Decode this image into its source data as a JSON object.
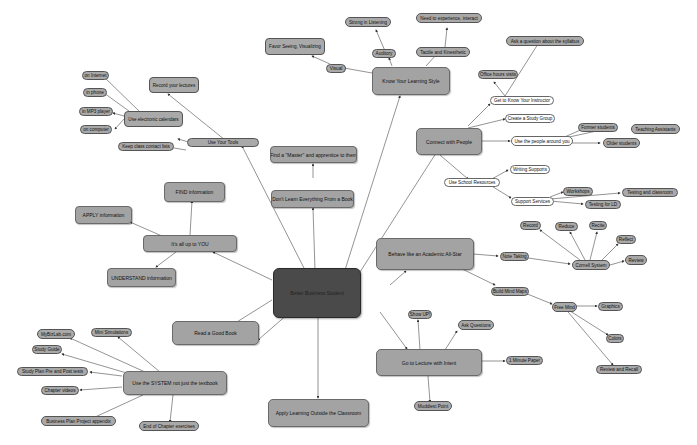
{
  "diagram": {
    "type": "mind-map",
    "colors": {
      "main_node": "#a3a3a3",
      "leaf_node": "#a9a9a9",
      "white_node": "#ffffff",
      "center_node": "#4a4a4a",
      "edge": "#555555"
    },
    "center": {
      "label": "Better Business Student"
    },
    "nodes": {
      "know_style": "Know Your Learning Style",
      "visual": "Visual",
      "favor_seeing": "Favor Seeing, Visualizing",
      "auditory": "Auditory",
      "strong_listening": "Strong in Listening",
      "tactile": "Tactile and Kinesthetic",
      "need_experience": "Need to experience, interact",
      "connect": "Connect with People",
      "get_know": "Get to Know Your Instructor",
      "ask_syllabus": "Ask a question about the syllabus",
      "office_hours": "Office hours visits",
      "study_group": "Create a Study Group",
      "use_people": "Use the people around you",
      "former_students": "Former students",
      "teaching_assistants": "Teaching Assistants",
      "older_students": "Older students",
      "school_resources": "Use School Resources",
      "writing_supports": "Writing Supports",
      "support_services": "Support Services",
      "workshops": "Workshops",
      "testing_classroom": "Testing and classroom",
      "testing_ld": "Testing for LD",
      "allstar": "Behave like an Academic All-Star",
      "note_taking": "Note Taking",
      "cornell": "Cornell System",
      "record": "Record",
      "reduce": "Reduce",
      "recite": "Recite",
      "reflect": "Reflect",
      "review": "Review",
      "mind_maps": "Build Mind Maps",
      "free_mind": "Free Mind",
      "graphics": "Graphics",
      "colors": "Colors",
      "review_recall": "Review and Recall",
      "lecture": "Go to Lecture with Intent",
      "show_up": "Show UP!",
      "ask_questions": "Ask Questions",
      "one_minute": "1 Minute Paper",
      "muddiest": "Muddiest Point",
      "apply_outside": "Apply Learning Outside the Classroom",
      "system": "Use the SYSTEM not just the textbook",
      "mybizlab": "MyBizLab.com",
      "mini_sim": "Mini Simulations",
      "study_guide": "Study Guide",
      "study_plan": "Study Plan Pre and Post tests",
      "chapter_videos": "Chapter videos",
      "biz_plan": "Business Plan Project appendix",
      "end_chapter": "End of Chapter exercises",
      "good_book": "Read a Good Book",
      "up_to_you": "It's all up to YOU",
      "find_info": "FIND information",
      "apply_info": "APPLY information",
      "understand_info": "UNDERSTAND information",
      "dont_learn": "Don't Learn Everything From a Book",
      "find_master": "Find a \"Master\" and apprentice to them",
      "tools": "Use Your Tools",
      "record_lectures": "Record your lectures",
      "calendars": "Use electronic calendars",
      "on_internet": "on Internet",
      "in_phone": "in phone",
      "in_mp3": "in MP3 player",
      "on_computer": "on computer",
      "contact_lists": "Keep class contact lists"
    }
  }
}
